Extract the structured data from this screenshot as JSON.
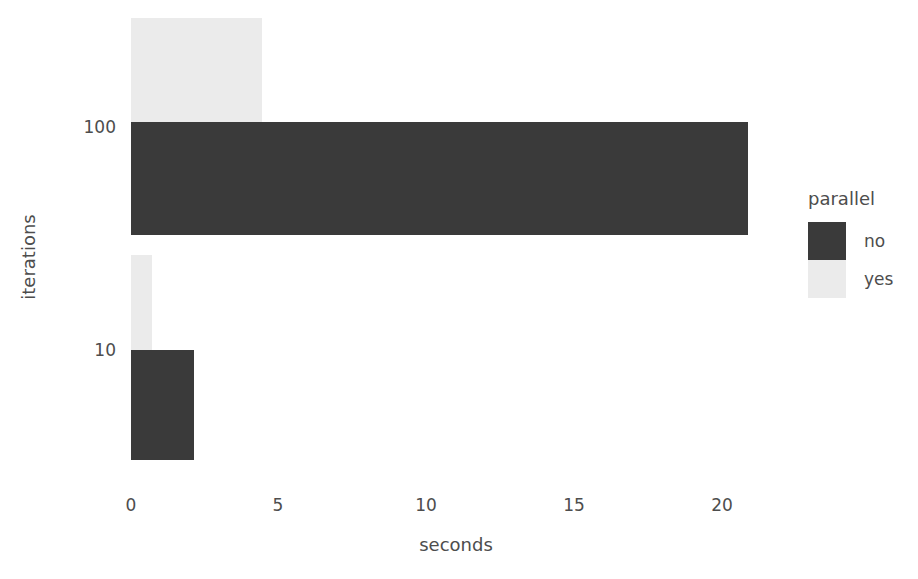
{
  "chart_data": {
    "type": "bar",
    "orientation": "horizontal",
    "title": "",
    "xlabel": "seconds",
    "ylabel": "iterations",
    "categories": [
      "10",
      "100"
    ],
    "xlim": [
      0,
      21.8
    ],
    "xticks": [
      0,
      5,
      10,
      15,
      20
    ],
    "xticklabels": [
      "0",
      "5",
      "10",
      "15",
      "20"
    ],
    "grid": false,
    "legend": {
      "title": "parallel",
      "position": "right",
      "entries": [
        {
          "label": "no",
          "color": "#3a3a3a"
        },
        {
          "label": "yes",
          "color": "#ebebeb"
        }
      ]
    },
    "series": [
      {
        "name": "no",
        "color": "#3a3a3a",
        "values": [
          2.1,
          20.7
        ]
      },
      {
        "name": "yes",
        "color": "#ebebeb",
        "values": [
          0.7,
          4.4
        ]
      }
    ],
    "points": [
      {
        "iterations": "100",
        "parallel": "yes",
        "seconds": 4.4
      },
      {
        "iterations": "100",
        "parallel": "no",
        "seconds": 20.7
      },
      {
        "iterations": "10",
        "parallel": "yes",
        "seconds": 0.7
      },
      {
        "iterations": "10",
        "parallel": "no",
        "seconds": 2.1
      }
    ]
  },
  "colors": {
    "background": "#ffffff",
    "text": "#4d4d4d",
    "no": "#3a3a3a",
    "yes": "#ebebeb"
  },
  "axis": {
    "x_tick_0": "0",
    "x_tick_1": "5",
    "x_tick_2": "10",
    "x_tick_3": "15",
    "x_tick_4": "20",
    "x_title": "seconds",
    "y_tick_100": "100",
    "y_tick_10": "10",
    "y_title": "iterations"
  },
  "legend": {
    "title": "parallel",
    "entry_no": "no",
    "entry_yes": "yes"
  }
}
